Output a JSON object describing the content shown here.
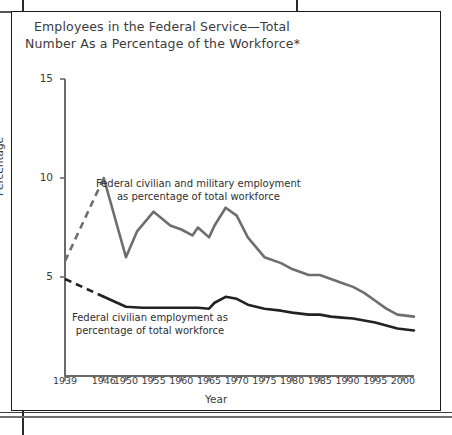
{
  "figure": {
    "title_line1": "Employees in the Federal Service—Total",
    "title_line2": "Number As a Percentage of the Workforce*"
  },
  "chart_data": {
    "type": "line",
    "title": "Employees in the Federal Service—Total Number As a Percentage of the Workforce*",
    "xlabel": "Year",
    "ylabel": "Percentage",
    "xlim": [
      1939,
      2002
    ],
    "ylim": [
      0,
      15
    ],
    "grid": false,
    "legend_position": "inline-annotations",
    "yticks": [
      5,
      10,
      15
    ],
    "ytick_labels": [
      "5",
      "10",
      "15"
    ],
    "xticks": [
      1939,
      1946,
      1950,
      1955,
      1960,
      1965,
      1970,
      1975,
      1980,
      1985,
      1990,
      1995,
      2000
    ],
    "xtick_labels": [
      "1939",
      "1946",
      "1950",
      "1955",
      "1960",
      "1965",
      "1970",
      "1975",
      "1980",
      "1985",
      "1990",
      "1995",
      "2000"
    ],
    "annotations": [
      {
        "name": "upper-series-annotation",
        "line1": "Federal civilian and military employment",
        "line2": "as percentage of total workforce"
      },
      {
        "name": "lower-series-annotation",
        "line1": "Federal civilian employment as",
        "line2": "percentage of total workforce"
      }
    ],
    "series": [
      {
        "name": "Federal civilian and military employment as percentage of total workforce",
        "color": "#6e6e6e",
        "width": 2.6,
        "dashed_segment": {
          "from_year": 1939,
          "to_year": 1946,
          "note": "interpolated (dashed) 1939-1946"
        },
        "x": [
          1939,
          1946,
          1950,
          1952,
          1955,
          1958,
          1960,
          1962,
          1963,
          1965,
          1966,
          1968,
          1970,
          1972,
          1975,
          1978,
          1980,
          1983,
          1985,
          1987,
          1989,
          1991,
          1993,
          1995,
          1997,
          1999,
          2002
        ],
        "values": [
          5.8,
          10.0,
          6.0,
          7.3,
          8.3,
          7.6,
          7.4,
          7.1,
          7.5,
          7.0,
          7.6,
          8.5,
          8.1,
          7.0,
          6.0,
          5.7,
          5.4,
          5.1,
          5.1,
          4.9,
          4.7,
          4.5,
          4.2,
          3.8,
          3.4,
          3.1,
          3.0
        ]
      },
      {
        "name": "Federal civilian employment as percentage of total workforce",
        "color": "#222222",
        "width": 2.6,
        "dashed_segment": {
          "from_year": 1939,
          "to_year": 1946,
          "note": "interpolated (dashed) 1939-1946"
        },
        "x": [
          1939,
          1946,
          1950,
          1953,
          1956,
          1960,
          1963,
          1965,
          1966,
          1968,
          1970,
          1972,
          1975,
          1978,
          1980,
          1983,
          1985,
          1987,
          1989,
          1991,
          1993,
          1995,
          1997,
          1999,
          2002
        ],
        "values": [
          4.9,
          4.0,
          3.5,
          3.45,
          3.45,
          3.45,
          3.45,
          3.4,
          3.7,
          4.0,
          3.9,
          3.6,
          3.4,
          3.3,
          3.2,
          3.1,
          3.1,
          3.0,
          2.95,
          2.9,
          2.8,
          2.7,
          2.55,
          2.4,
          2.3
        ]
      }
    ]
  }
}
